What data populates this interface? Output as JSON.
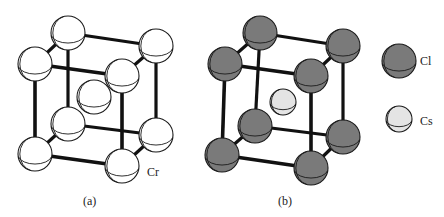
{
  "colors": {
    "background": "#ffffff",
    "bond": "#111111",
    "outline": "#1a1a1a",
    "cr_fill": "#ffffff",
    "cl_fill": "#7a7a7a",
    "cs_fill": "#e4e4e4"
  },
  "panels": [
    {
      "id": "a",
      "caption": "(a)",
      "caption_pos": [
        83,
        205
      ],
      "structure": "body-centered cubic chromium",
      "atom_label": {
        "text": "Cr",
        "x": 147,
        "y": 176
      },
      "corners": {
        "btl": [
          68,
          33
        ],
        "btr": [
          156,
          46
        ],
        "ftl": [
          35,
          64
        ],
        "ftr": [
          122,
          76
        ],
        "bbl": [
          68,
          124
        ],
        "bbr": [
          156,
          135
        ],
        "fbl": [
          35,
          154
        ],
        "fbr": [
          122,
          166
        ]
      },
      "corner_radius": 17,
      "corner_species": "Cr",
      "center": {
        "x": 94,
        "y": 97,
        "r": 17,
        "species": "Cr"
      }
    },
    {
      "id": "b",
      "caption": "(b)",
      "caption_pos": [
        278,
        205
      ],
      "structure": "cesium chloride",
      "corners": {
        "btl": [
          260,
          33
        ],
        "btr": [
          343,
          46
        ],
        "ftl": [
          225,
          64
        ],
        "ftr": [
          311,
          76
        ],
        "bbl": [
          255,
          126
        ],
        "bbr": [
          343,
          137
        ],
        "fbl": [
          222,
          155
        ],
        "fbr": [
          311,
          168
        ]
      },
      "corner_radius": 17,
      "corner_species": "Cl",
      "center": {
        "x": 283,
        "y": 102,
        "r": 13,
        "species": "Cs"
      }
    }
  ],
  "legend": [
    {
      "label": "Cl",
      "species": "Cl",
      "x": 399,
      "y": 61,
      "r": 17,
      "label_x": 420,
      "label_y": 65
    },
    {
      "label": "Cs",
      "species": "Cs",
      "x": 399,
      "y": 119,
      "r": 13,
      "label_x": 420,
      "label_y": 125
    }
  ]
}
